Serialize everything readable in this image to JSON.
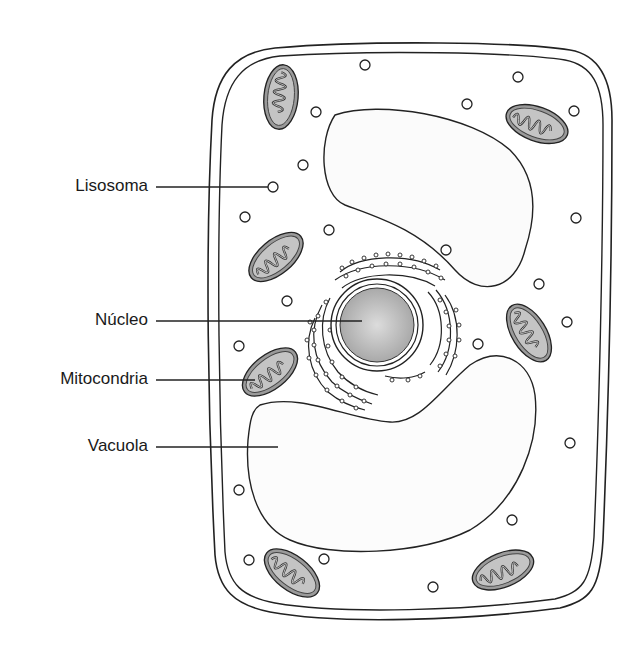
{
  "diagram": {
    "labels": [
      {
        "id": "lisosoma",
        "text": "Lisosoma",
        "x": 130,
        "y": 186,
        "line_x1": 156,
        "line_x2": 268
      },
      {
        "id": "nucleo",
        "text": "Núcleo",
        "x": 130,
        "y": 321,
        "line_x1": 156,
        "line_x2": 362
      },
      {
        "id": "mitocondria",
        "text": "Mitocondria",
        "x": 130,
        "y": 380,
        "line_x1": 156,
        "line_x2": 255
      },
      {
        "id": "vacuola",
        "text": "Vacuola",
        "x": 130,
        "y": 447,
        "line_x1": 156,
        "line_x2": 278
      }
    ],
    "colors": {
      "stroke": "#222222",
      "nucleus_fill": "#c8c8c8",
      "mito_fill": "#9a9a9a",
      "mito_inner": "#c4c4c4",
      "background": "#ffffff"
    }
  }
}
